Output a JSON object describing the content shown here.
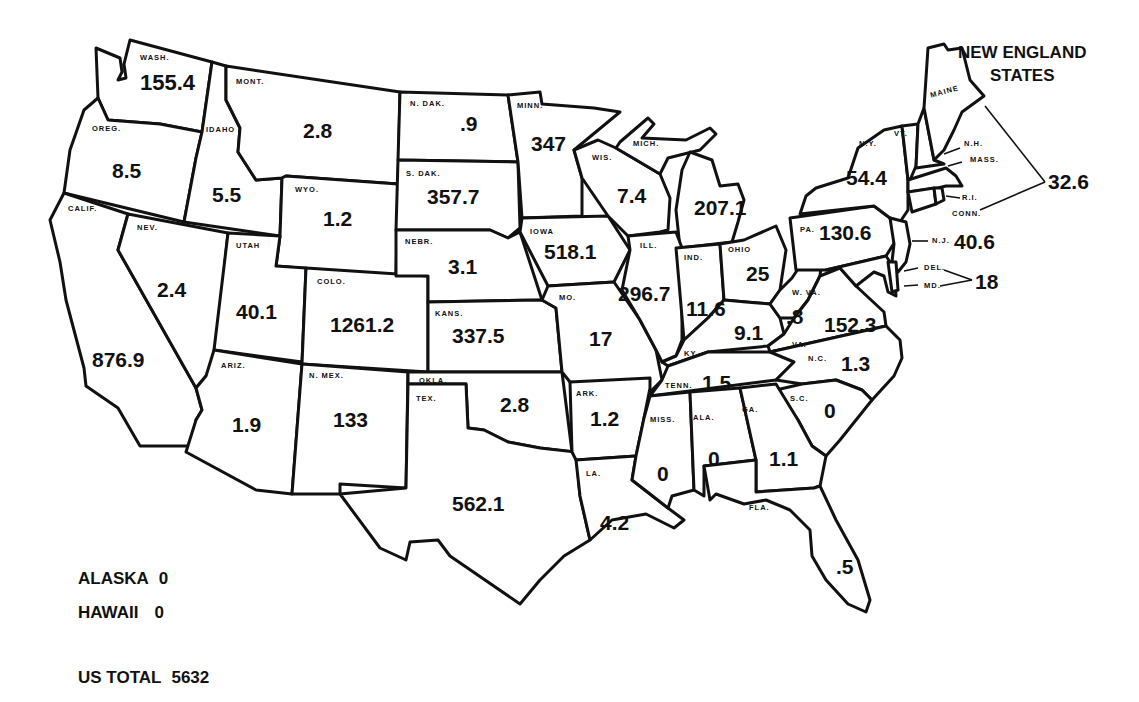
{
  "map": {
    "type": "choropleth-values",
    "region": "United States",
    "states": [
      {
        "abbr": "WASH.",
        "name": "Washington",
        "value": "155.4"
      },
      {
        "abbr": "OREG.",
        "name": "Oregon",
        "value": "8.5"
      },
      {
        "abbr": "CALIF.",
        "name": "California",
        "value": "876.9"
      },
      {
        "abbr": "IDAHO",
        "name": "Idaho",
        "value": "5.5"
      },
      {
        "abbr": "NEV.",
        "name": "Nevada",
        "value": "2.4"
      },
      {
        "abbr": "MONT.",
        "name": "Montana",
        "value": "2.8"
      },
      {
        "abbr": "WYO.",
        "name": "Wyoming",
        "value": "1.2"
      },
      {
        "abbr": "UTAH",
        "name": "Utah",
        "value": "40.1"
      },
      {
        "abbr": "COLO.",
        "name": "Colorado",
        "value": "1261.2"
      },
      {
        "abbr": "ARIZ.",
        "name": "Arizona",
        "value": "1.9"
      },
      {
        "abbr": "N. MEX.",
        "name": "New Mexico",
        "value": "133"
      },
      {
        "abbr": "N. DAK.",
        "name": "North Dakota",
        "value": ".9"
      },
      {
        "abbr": "S. DAK.",
        "name": "South Dakota",
        "value": "357.7"
      },
      {
        "abbr": "NEBR.",
        "name": "Nebraska",
        "value": "3.1"
      },
      {
        "abbr": "KANS.",
        "name": "Kansas",
        "value": "337.5"
      },
      {
        "abbr": "OKLA.",
        "name": "Oklahoma",
        "value": "2.8"
      },
      {
        "abbr": "TEX.",
        "name": "Texas",
        "value": "562.1"
      },
      {
        "abbr": "MINN.",
        "name": "Minnesota",
        "value": "347"
      },
      {
        "abbr": "IOWA",
        "name": "Iowa",
        "value": "518.1"
      },
      {
        "abbr": "MO.",
        "name": "Missouri",
        "value": "17"
      },
      {
        "abbr": "ARK.",
        "name": "Arkansas",
        "value": "1.2"
      },
      {
        "abbr": "LA.",
        "name": "Louisiana",
        "value": "4.2"
      },
      {
        "abbr": "WIS.",
        "name": "Wisconsin",
        "value": "7.4"
      },
      {
        "abbr": "MICH.",
        "name": "Michigan",
        "value": "207.1"
      },
      {
        "abbr": "ILL.",
        "name": "Illinois",
        "value": "296.7"
      },
      {
        "abbr": "IND.",
        "name": "Indiana",
        "value": "11.6"
      },
      {
        "abbr": "OHIO",
        "name": "Ohio",
        "value": "25"
      },
      {
        "abbr": "KY.",
        "name": "Kentucky",
        "value": "9.1"
      },
      {
        "abbr": "TENN.",
        "name": "Tennessee",
        "value": "1.5"
      },
      {
        "abbr": "MISS.",
        "name": "Mississippi",
        "value": "0"
      },
      {
        "abbr": "ALA.",
        "name": "Alabama",
        "value": "0"
      },
      {
        "abbr": "GA.",
        "name": "Georgia",
        "value": "1.1"
      },
      {
        "abbr": "FLA.",
        "name": "Florida",
        "value": ".5"
      },
      {
        "abbr": "S.C.",
        "name": "South Carolina",
        "value": "0"
      },
      {
        "abbr": "N.C.",
        "name": "North Carolina",
        "value": "1.3"
      },
      {
        "abbr": "VA.",
        "name": "Virginia",
        "value": "152.3"
      },
      {
        "abbr": "W. VA.",
        "name": "West Virginia",
        "value": ".8"
      },
      {
        "abbr": "PA.",
        "name": "Pennsylvania",
        "value": "130.6"
      },
      {
        "abbr": "N.Y.",
        "name": "New York",
        "value": "54.4"
      },
      {
        "abbr": "N.J.",
        "name": "New Jersey",
        "value": "40.6"
      }
    ],
    "grouped": [
      {
        "label": "NEW ENGLAND STATES",
        "members": [
          "MAINE",
          "VT.",
          "N.H.",
          "MASS.",
          "R.I.",
          "CONN."
        ],
        "value": "32.6"
      },
      {
        "label": "DEL./MD.",
        "members": [
          "DEL.",
          "MD."
        ],
        "value": "18"
      }
    ],
    "new_england_title_line1": "NEW ENGLAND",
    "new_england_title_line2": "STATES",
    "ne_labels": {
      "maine": "MAINE",
      "vt": "VT.",
      "nh": "N.H.",
      "mass": "MASS.",
      "ri": "R.I.",
      "conn": "CONN.",
      "del": "DEL.",
      "md": "MD."
    }
  },
  "legend": {
    "alaska_label": "ALASKA",
    "alaska_value": "0",
    "hawaii_label": "HAWAII",
    "hawaii_value": "0",
    "total_label": "US TOTAL",
    "total_value": "5632"
  }
}
